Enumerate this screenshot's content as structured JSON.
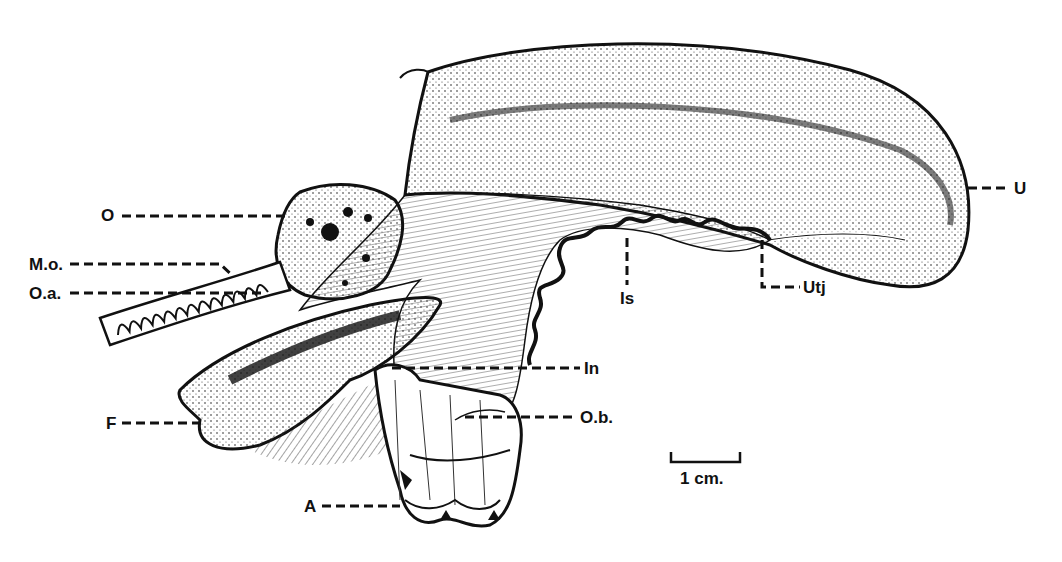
{
  "figure": {
    "type": "anatomical line drawing (stippled)",
    "labels": [
      {
        "id": "O",
        "text": "O"
      },
      {
        "id": "Mo",
        "text": "M.o."
      },
      {
        "id": "Oa",
        "text": "O.a."
      },
      {
        "id": "F",
        "text": "F"
      },
      {
        "id": "A",
        "text": "A"
      },
      {
        "id": "In",
        "text": "In"
      },
      {
        "id": "Ob",
        "text": "O.b."
      },
      {
        "id": "Is",
        "text": "Is"
      },
      {
        "id": "Utj",
        "text": "Utj"
      },
      {
        "id": "U",
        "text": "U"
      }
    ],
    "scale_bar": {
      "text": "1 cm."
    }
  },
  "colors": {
    "ink": "#111111",
    "background": "#ffffff"
  }
}
